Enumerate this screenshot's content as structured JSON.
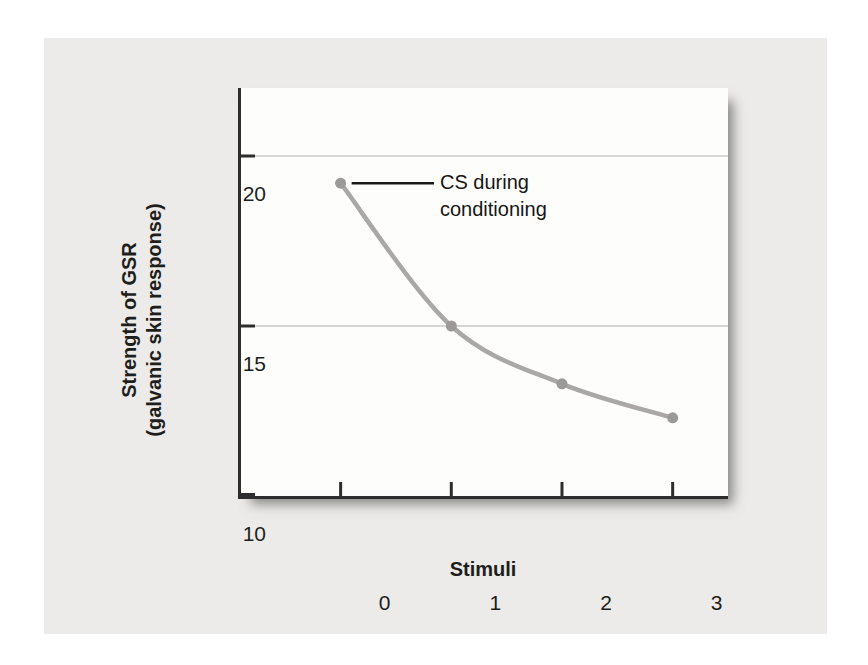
{
  "figure": {
    "y_axis_title": {
      "line1": "Strength of GSR",
      "line2": "(galvanic skin response)"
    },
    "annotation": {
      "line1": "CS during",
      "line2": "conditioning"
    }
  },
  "chart_data": {
    "type": "line",
    "title": "",
    "xlabel": "Stimuli",
    "ylabel": "Strength of GSR (galvanic skin response)",
    "x": [
      0,
      1,
      2,
      3
    ],
    "series": [
      {
        "name": "CS during conditioning",
        "values": [
          19.2,
          15.0,
          13.3,
          12.3
        ]
      }
    ],
    "x_tick_values": [
      0,
      1,
      2,
      3
    ],
    "x_tick_labels": [
      "0",
      "1",
      "2",
      "3"
    ],
    "y_tick_values": [
      20,
      15,
      10
    ],
    "y_tick_labels": [
      "20",
      "15",
      "10"
    ],
    "gridlines_at": [
      20,
      15
    ],
    "xlim": [
      -0.9,
      3.5
    ],
    "ylim": [
      10,
      22
    ],
    "grid": "horizontal gridlines at 20 and 15 only",
    "legend_position": "none",
    "annotation": {
      "text": "CS during conditioning",
      "target": {
        "x": 0,
        "y": 19.2
      }
    },
    "colors": {
      "line": "#a9a8a6",
      "marker": "#9b9a98",
      "axis": "#2d2d2d",
      "grid": "#c9c8c6",
      "panel_bg": "#ecebe9",
      "plot_bg": "#fdfdfc",
      "text": "#1e1e1c",
      "leader_line": "#1a1a18"
    }
  }
}
